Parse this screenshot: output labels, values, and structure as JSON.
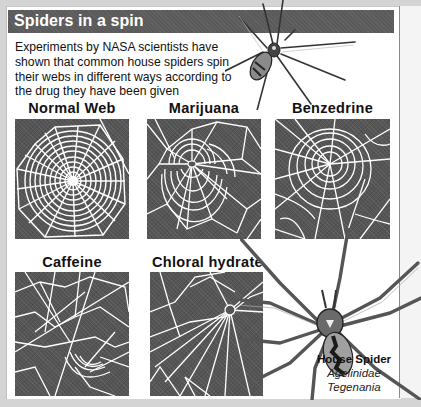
{
  "header": {
    "title": "Spiders in a spin"
  },
  "intro": {
    "text": "Experiments by NASA scientists have shown that common house spiders spin their webs in different ways according to the drug they have been given"
  },
  "panels": [
    {
      "label": "Normal Web",
      "description": "regular orb web with even spirals"
    },
    {
      "label": "Marijuana",
      "description": "web with incomplete outer spirals"
    },
    {
      "label": "Benzedrine",
      "description": "web with erratic, gapped spirals"
    },
    {
      "label": "Caffeine",
      "description": "chaotic web with random strands"
    },
    {
      "label": "Chloral hydrate",
      "description": "web with only a few radial strands"
    }
  ],
  "spider_caption": {
    "name": "House Spider",
    "family": "Agelinidae",
    "genus": "Tegenania"
  },
  "colors": {
    "title_bar": "#5a5a5a",
    "panel_bg": "#555555",
    "web_strand": "#ffffff",
    "outer_bg": "#d4d4d4"
  }
}
